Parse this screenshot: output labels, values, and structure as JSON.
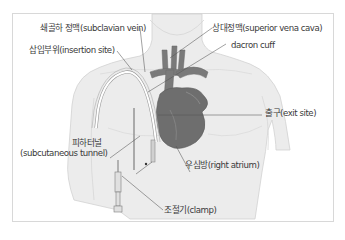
{
  "diagram": {
    "labels": {
      "subclavian_vein": "쇄골하 정맥(subclavian vein)",
      "insertion_site": "삽입부위(insertion site)",
      "superior_vena_cava": "상대정맥(superior vena cava)",
      "dacron_cuff": "dacron cuff",
      "exit_site": "출구(exit site)",
      "subcutaneous_tunnel_ko": "피하터널",
      "subcutaneous_tunnel_en": "(subcutaneous tunnel)",
      "right_atrium": "우심방(right atrium)",
      "clamp": "조절기(clamp)"
    },
    "colors": {
      "skin": "#e9e9e9",
      "skin_outline": "#cfcfcf",
      "heart": "#6e6e6e",
      "vessel": "#777777",
      "catheter": "#ffffff",
      "leader_line": "#555555",
      "text": "#3a3a3a",
      "frame_border": "#d8d8d8"
    }
  }
}
